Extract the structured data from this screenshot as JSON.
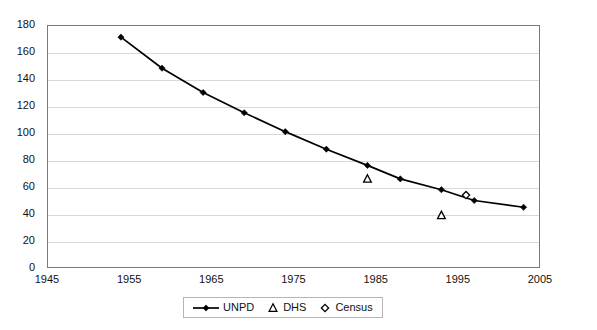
{
  "chart_data": {
    "type": "line",
    "title": "",
    "xlabel": "",
    "ylabel": "",
    "xlim": [
      1945,
      2005
    ],
    "ylim": [
      0,
      180
    ],
    "grid": true,
    "legend_position": "bottom-center",
    "x_ticks": [
      1945,
      1955,
      1965,
      1975,
      1985,
      1995,
      2005
    ],
    "y_ticks": [
      0,
      20,
      40,
      60,
      80,
      100,
      120,
      140,
      160,
      180
    ],
    "series": [
      {
        "name": "UNPD",
        "type": "line",
        "marker": "filled-diamond",
        "color": "#000000",
        "points": [
          {
            "x": 1954,
            "y": 171
          },
          {
            "x": 1959,
            "y": 148
          },
          {
            "x": 1964,
            "y": 130
          },
          {
            "x": 1969,
            "y": 115
          },
          {
            "x": 1974,
            "y": 101
          },
          {
            "x": 1979,
            "y": 88
          },
          {
            "x": 1984,
            "y": 76
          },
          {
            "x": 1988,
            "y": 66
          },
          {
            "x": 1993,
            "y": 58
          },
          {
            "x": 1997,
            "y": 50
          },
          {
            "x": 2003,
            "y": 45
          }
        ]
      },
      {
        "name": "DHS",
        "type": "scatter",
        "marker": "open-triangle",
        "color": "#000000",
        "points": [
          {
            "x": 1984,
            "y": 66
          },
          {
            "x": 1993,
            "y": 39
          }
        ]
      },
      {
        "name": "Census",
        "type": "scatter",
        "marker": "open-diamond",
        "color": "#000000",
        "points": [
          {
            "x": 1996,
            "y": 54
          }
        ]
      }
    ]
  },
  "legend": {
    "items": [
      {
        "label": "UNPD",
        "glyph": "line-with-filled-diamond-icon"
      },
      {
        "label": "DHS",
        "glyph": "open-triangle-icon"
      },
      {
        "label": "Census",
        "glyph": "open-diamond-icon"
      }
    ]
  },
  "colors": {
    "series": "#000000",
    "gridline": "#d9d9d9",
    "frame": "#7a7a7a",
    "background": "#ffffff",
    "text": "#111111"
  }
}
